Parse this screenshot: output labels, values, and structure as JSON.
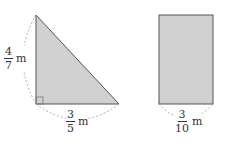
{
  "triangle": {
    "shape": "right-triangle",
    "fill": "#d0d0d0",
    "stroke": "#555555",
    "height_label": {
      "num": "4",
      "den": "7",
      "unit": "m"
    },
    "base_label": {
      "num": "3",
      "den": "5",
      "unit": "m"
    }
  },
  "rectangle": {
    "shape": "rectangle",
    "fill": "#d0d0d0",
    "stroke": "#555555",
    "width_label": {
      "num": "3",
      "den": "10",
      "unit": "m"
    }
  }
}
